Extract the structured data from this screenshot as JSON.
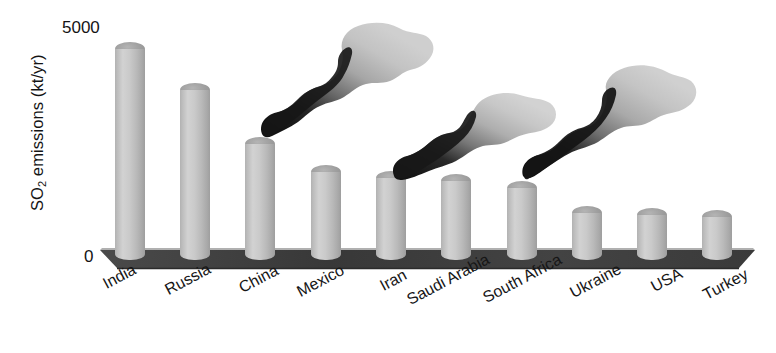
{
  "chart_data": {
    "type": "bar",
    "title": "",
    "subtitle": "",
    "xlabel": "",
    "ylabel": "SO2 emissions (kt/yr)",
    "ylabel_parts": {
      "prefix": "SO",
      "sub": "2",
      "suffix": " emissions (kt/yr)"
    },
    "categories": [
      "India",
      "Russia",
      "China",
      "Mexico",
      "Iran",
      "Saudi Arabia",
      "South Africa",
      "Ukraine",
      "USA",
      "Turkey"
    ],
    "values": [
      4800,
      3900,
      2700,
      2100,
      1950,
      1900,
      1750,
      1200,
      1150,
      1100
    ],
    "ylim": [
      0,
      5000
    ],
    "ytick_labels": [
      "0",
      "5000"
    ],
    "ytick_values": [
      0,
      5000
    ],
    "grid": false,
    "legend": null,
    "style": "3d-cylinder-bars",
    "annotations": [
      {
        "name": "smoke-plume",
        "over_category": "China",
        "direction": "up-right"
      },
      {
        "name": "smoke-plume",
        "over_category": "Iran",
        "direction": "up-right"
      },
      {
        "name": "smoke-plume",
        "over_category": "South Africa",
        "direction": "up-right"
      }
    ],
    "colors": {
      "bar_light": "#d2d2d2",
      "bar_mid": "#bdbdbd",
      "bar_dark": "#9e9e9e",
      "bar_top": "#9d9d9d",
      "ground": "#3b3b3b",
      "ground_edge": "#6d6d6d",
      "text": "#141414",
      "smoke_dark": "#1c1c1c",
      "smoke_light": "#c9c9c9",
      "background": "#ffffff"
    }
  }
}
